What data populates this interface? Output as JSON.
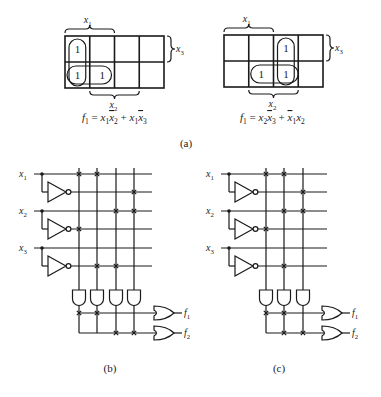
{
  "figure": {
    "kmap_a1": {
      "top_label": "x1",
      "right_label": "x3",
      "bottom_label": "x2",
      "cells": [
        [
          "1",
          "",
          "",
          ""
        ],
        [
          "1",
          "1",
          "",
          ""
        ]
      ],
      "equation": "f1 = x1x̄2 + x1x̄3",
      "groups": [
        "column-0 vertical pair",
        "row-1 horizontal pair cols 0-1"
      ]
    },
    "kmap_a2": {
      "top_label": "x1",
      "right_label": "x3",
      "bottom_label": "x2",
      "cells": [
        [
          "",
          "",
          "1",
          ""
        ],
        [
          "",
          "1",
          "1",
          ""
        ]
      ],
      "equation": "f1 = x2x̄3 + x̄1x2",
      "groups": [
        "column-2 vertical pair",
        "row-1 horizontal pair cols 1-2"
      ]
    },
    "caption_a": "(a)",
    "pla_b": {
      "inputs": [
        "x1",
        "x2",
        "x3"
      ],
      "outputs": [
        "f1",
        "f2"
      ],
      "product_terms": 4,
      "and_plane_crosses": [
        {
          "row": "x1",
          "cols": [
            0,
            1
          ]
        },
        {
          "row": "x1_bar",
          "cols": [
            3
          ]
        },
        {
          "row": "x2",
          "cols": [
            2,
            3
          ]
        },
        {
          "row": "x2_bar",
          "cols": [
            0
          ]
        },
        {
          "row": "x3",
          "cols": []
        },
        {
          "row": "x3_bar",
          "cols": [
            1,
            2
          ]
        }
      ],
      "or_plane_crosses": [
        {
          "output": "f1",
          "cols": [
            0,
            1
          ]
        },
        {
          "output": "f2",
          "cols": [
            2,
            3
          ]
        }
      ],
      "caption": "(b)"
    },
    "pla_c": {
      "inputs": [
        "x1",
        "x2",
        "x3"
      ],
      "outputs": [
        "f1",
        "f2"
      ],
      "product_terms": 3,
      "and_plane_crosses": [
        {
          "row": "x1",
          "cols": [
            0,
            1
          ]
        },
        {
          "row": "x1_bar",
          "cols": [
            2
          ]
        },
        {
          "row": "x2",
          "cols": [
            1,
            2
          ]
        },
        {
          "row": "x2_bar",
          "cols": [
            0
          ]
        },
        {
          "row": "x3",
          "cols": []
        },
        {
          "row": "x3_bar",
          "cols": [
            1
          ]
        }
      ],
      "or_plane_crosses": [
        {
          "output": "f1",
          "cols": [
            0,
            1
          ]
        },
        {
          "output": "f2",
          "cols": [
            1,
            2
          ]
        }
      ],
      "caption": "(c)"
    }
  },
  "labels": {
    "x1": "x",
    "x1_sub": "1",
    "x2": "x",
    "x2_sub": "2",
    "x3": "x",
    "x3_sub": "3",
    "f": "f",
    "f1_sub": "1",
    "f2_sub": "2",
    "one": "1"
  }
}
